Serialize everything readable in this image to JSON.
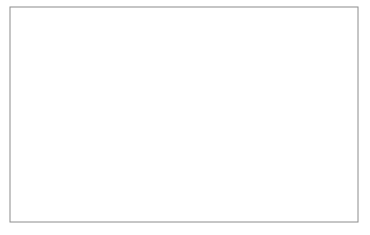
{
  "figure": {
    "title": "",
    "background_color": "#ffffff",
    "width": 370,
    "height": 235
  },
  "plot_area": {
    "left": 10,
    "top": 7,
    "right": 358,
    "bottom": 222,
    "frame_color": "#8c8c8c",
    "frame_width": 1.0,
    "fill_color": "#ffffff"
  },
  "grid": {
    "visible": true,
    "style": "dotted",
    "color": "#9a9a9a",
    "vertical_count": 16,
    "horizontal_count": 8,
    "vertical_positions": [
      31.0,
      51.5,
      72.0,
      92.5,
      113.0,
      133.5,
      154.0,
      174.5,
      195.0,
      215.5,
      236.0,
      256.5,
      277.0,
      297.5,
      318.0,
      338.5
    ],
    "horizontal_positions": [
      30.9,
      54.8,
      78.7,
      102.6,
      126.5,
      150.4,
      174.3,
      198.2
    ]
  },
  "reference_lines": {
    "style": "solid",
    "color": "#7d7d7d",
    "width": 1.3,
    "y_positions": [
      70.0,
      160.0
    ],
    "labels": [
      "upper-level",
      "lower-level"
    ]
  },
  "chart_data": {
    "type": "line",
    "xlabel": "",
    "ylabel": "",
    "xlim": [
      0,
      2.0
    ],
    "ylim": [
      -1.45,
      1.45
    ],
    "grid": true,
    "legend": null,
    "x_unit": "symbol periods",
    "n_samples": 181,
    "line_color": "#3a3a3a",
    "line_width": 0.9,
    "period_px": 180,
    "crossing_x_px": [
      -40,
      130,
      310
    ],
    "amplitude_levels": [
      1.0,
      0.78,
      0.6,
      0.45,
      0.3,
      0.16
    ],
    "series": [
      {
        "name": "level-1-positive",
        "amplitude": 1.0,
        "polarity": 1,
        "plateau_y_px": 35.0
      },
      {
        "name": "level-2-positive",
        "amplitude": 0.78,
        "polarity": 1,
        "plateau_y_px": 48.0
      },
      {
        "name": "level-3-positive",
        "amplitude": 0.6,
        "polarity": 1,
        "plateau_y_px": 58.0
      },
      {
        "name": "level-4-positive",
        "amplitude": 0.45,
        "polarity": 1,
        "plateau_y_px": 66.5
      },
      {
        "name": "level-5-positive",
        "amplitude": 0.3,
        "polarity": 1,
        "plateau_y_px": 75.0
      },
      {
        "name": "level-6-positive",
        "amplitude": 0.16,
        "polarity": 1,
        "plateau_y_px": 83.0
      },
      {
        "name": "level-1-negative",
        "amplitude": 1.0,
        "polarity": -1,
        "plateau_y_px": 195.0
      },
      {
        "name": "level-2-negative",
        "amplitude": 0.78,
        "polarity": -1,
        "plateau_y_px": 182.0
      },
      {
        "name": "level-3-negative",
        "amplitude": 0.6,
        "polarity": -1,
        "plateau_y_px": 172.0
      },
      {
        "name": "level-4-negative",
        "amplitude": 0.45,
        "polarity": -1,
        "plateau_y_px": 163.5
      },
      {
        "name": "level-5-negative",
        "amplitude": 0.3,
        "polarity": -1,
        "plateau_y_px": 155.0
      },
      {
        "name": "level-6-negative",
        "amplitude": 0.16,
        "polarity": -1,
        "plateau_y_px": 147.0
      }
    ],
    "axis_zero_y_px": 115.0,
    "tick_labels_x": [],
    "tick_labels_y": []
  }
}
